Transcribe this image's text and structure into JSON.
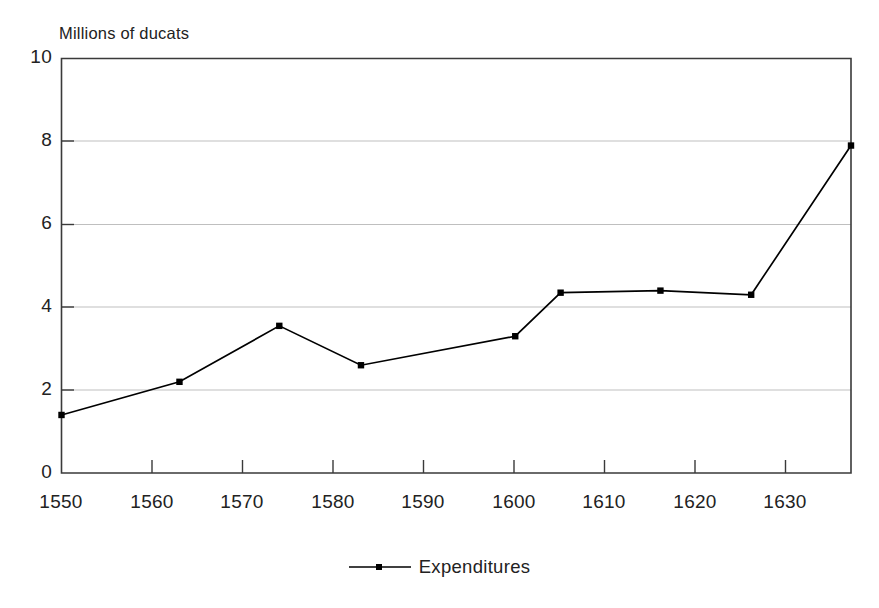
{
  "figure": {
    "faint_cut_title": "",
    "y_axis_title": "Millions of ducats"
  },
  "legend": {
    "position": "bottom-center",
    "entries": [
      {
        "label": "Expenditures",
        "symbol": "line-with-square-marker",
        "color": "#000000"
      }
    ]
  },
  "axes": {
    "y_ticks": [
      "10",
      "8",
      "6",
      "4",
      "2",
      "0"
    ],
    "x_ticks": [
      "1550",
      "1560",
      "1570",
      "1580",
      "1590",
      "1600",
      "1610",
      "1620",
      "1630"
    ]
  },
  "chart_data": {
    "type": "line",
    "title": "",
    "xlabel": "",
    "ylabel": "Millions of ducats",
    "xlim": [
      1550,
      1637
    ],
    "ylim": [
      0,
      10
    ],
    "xticks": [
      1550,
      1560,
      1570,
      1580,
      1590,
      1600,
      1610,
      1620,
      1630
    ],
    "yticks": [
      0,
      2,
      4,
      6,
      8,
      10
    ],
    "grid": "horizontal",
    "legend_position": "bottom-center",
    "series": [
      {
        "name": "Expenditures",
        "color": "#000000",
        "marker": "square",
        "x": [
          1550,
          1563,
          1574,
          1583,
          1600,
          1605,
          1616,
          1626,
          1637
        ],
        "values": [
          1.4,
          2.2,
          3.55,
          2.6,
          3.3,
          4.35,
          4.4,
          4.3,
          7.9
        ]
      }
    ]
  }
}
